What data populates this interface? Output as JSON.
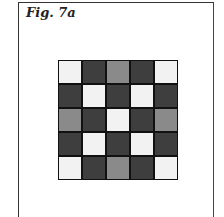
{
  "figure": {
    "caption": "Fig. 7a",
    "grid": {
      "rows": 5,
      "cols": 5,
      "colors": {
        "W": "#f2f2f2",
        "D": "#3e3e3e",
        "G": "#8a8a8a"
      },
      "cells": [
        [
          "W",
          "D",
          "G",
          "D",
          "W"
        ],
        [
          "D",
          "W",
          "D",
          "W",
          "D"
        ],
        [
          "G",
          "D",
          "W",
          "D",
          "G"
        ],
        [
          "D",
          "W",
          "D",
          "W",
          "D"
        ],
        [
          "W",
          "D",
          "G",
          "D",
          "W"
        ]
      ]
    }
  }
}
